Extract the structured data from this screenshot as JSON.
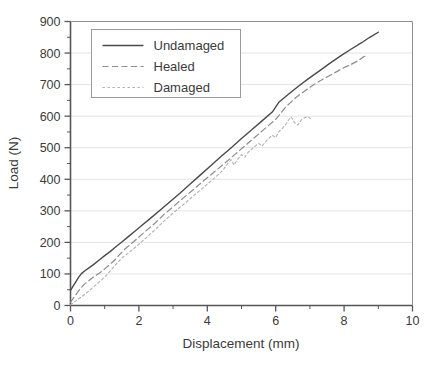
{
  "chart_data": {
    "type": "line",
    "title": "",
    "xlabel": "Displacement (mm)",
    "ylabel": "Load (N)",
    "xlim": [
      0,
      10
    ],
    "ylim": [
      0,
      900
    ],
    "xticks": [
      0,
      2,
      4,
      6,
      8,
      10
    ],
    "yticks": [
      0,
      100,
      200,
      300,
      400,
      500,
      600,
      700,
      800,
      900
    ],
    "xtick_labels": [
      "0",
      "2",
      "4",
      "6",
      "8",
      "10"
    ],
    "ytick_labels": [
      "0",
      "100",
      "200",
      "300",
      "400",
      "500",
      "600",
      "700",
      "800",
      "900"
    ],
    "x_minor_step": 1,
    "y_minor_step": 50,
    "grid": {
      "horizontal": true,
      "vertical": false,
      "color": "#e3e3e3"
    },
    "legend": {
      "position": "top-left-inside",
      "entries": [
        "Undamaged",
        "Healed",
        "Damaged"
      ]
    },
    "series": [
      {
        "name": "Undamaged",
        "style": "solid",
        "color": "#4a4a4a",
        "points": [
          [
            0.0,
            48
          ],
          [
            0.08,
            62
          ],
          [
            0.16,
            76
          ],
          [
            0.24,
            90
          ],
          [
            0.32,
            101
          ],
          [
            0.42,
            110
          ],
          [
            0.55,
            120
          ],
          [
            0.7,
            132
          ],
          [
            0.85,
            145
          ],
          [
            1.0,
            158
          ],
          [
            1.15,
            170
          ],
          [
            1.3,
            184
          ],
          [
            1.5,
            201
          ],
          [
            1.7,
            219
          ],
          [
            1.9,
            237
          ],
          [
            2.1,
            255
          ],
          [
            2.3,
            273
          ],
          [
            2.6,
            300
          ],
          [
            2.9,
            328
          ],
          [
            3.2,
            356
          ],
          [
            3.5,
            385
          ],
          [
            3.8,
            414
          ],
          [
            4.1,
            443
          ],
          [
            4.4,
            472
          ],
          [
            4.7,
            500
          ],
          [
            5.0,
            529
          ],
          [
            5.3,
            557
          ],
          [
            5.6,
            585
          ],
          [
            5.9,
            613
          ],
          [
            6.1,
            645
          ],
          [
            6.4,
            672
          ],
          [
            6.7,
            698
          ],
          [
            7.0,
            722
          ],
          [
            7.3,
            745
          ],
          [
            7.6,
            769
          ],
          [
            7.9,
            791
          ],
          [
            8.2,
            812
          ],
          [
            8.5,
            832
          ],
          [
            8.75,
            850
          ],
          [
            9.0,
            866
          ]
        ]
      },
      {
        "name": "Healed",
        "style": "dashed",
        "color": "#8c8c8c",
        "points": [
          [
            0.0,
            10
          ],
          [
            0.1,
            26
          ],
          [
            0.2,
            41
          ],
          [
            0.3,
            55
          ],
          [
            0.4,
            67
          ],
          [
            0.55,
            80
          ],
          [
            0.7,
            92
          ],
          [
            0.85,
            103
          ],
          [
            1.0,
            116
          ],
          [
            1.15,
            130
          ],
          [
            1.3,
            145
          ],
          [
            1.45,
            163
          ],
          [
            1.6,
            180
          ],
          [
            1.8,
            198
          ],
          [
            2.0,
            217
          ],
          [
            2.2,
            236
          ],
          [
            2.45,
            259
          ],
          [
            2.7,
            285
          ],
          [
            3.0,
            313
          ],
          [
            3.3,
            341
          ],
          [
            3.6,
            368
          ],
          [
            3.9,
            396
          ],
          [
            4.2,
            423
          ],
          [
            4.5,
            450
          ],
          [
            4.8,
            478
          ],
          [
            5.1,
            506
          ],
          [
            5.4,
            534
          ],
          [
            5.7,
            562
          ],
          [
            6.0,
            590
          ],
          [
            6.3,
            630
          ],
          [
            6.6,
            660
          ],
          [
            6.9,
            684
          ],
          [
            7.2,
            706
          ],
          [
            7.5,
            724
          ],
          [
            7.8,
            742
          ],
          [
            8.0,
            754
          ],
          [
            8.2,
            764
          ],
          [
            8.4,
            775
          ],
          [
            8.55,
            787
          ],
          [
            8.65,
            792
          ]
        ]
      },
      {
        "name": "Damaged",
        "style": "dotted",
        "color": "#b0b0b0",
        "points": [
          [
            0.0,
            2
          ],
          [
            0.15,
            14
          ],
          [
            0.3,
            26
          ],
          [
            0.45,
            38
          ],
          [
            0.6,
            52
          ],
          [
            0.75,
            66
          ],
          [
            0.9,
            80
          ],
          [
            1.05,
            96
          ],
          [
            1.2,
            114
          ],
          [
            1.35,
            133
          ],
          [
            1.5,
            150
          ],
          [
            1.7,
            167
          ],
          [
            1.9,
            185
          ],
          [
            2.1,
            204
          ],
          [
            2.3,
            223
          ],
          [
            2.5,
            243
          ],
          [
            2.7,
            264
          ],
          [
            3.0,
            293
          ],
          [
            3.3,
            320
          ],
          [
            3.6,
            348
          ],
          [
            3.9,
            375
          ],
          [
            4.2,
            403
          ],
          [
            4.45,
            428
          ],
          [
            4.6,
            450
          ],
          [
            4.7,
            462
          ],
          [
            4.78,
            445
          ],
          [
            4.88,
            462
          ],
          [
            5.0,
            478
          ],
          [
            5.1,
            470
          ],
          [
            5.2,
            486
          ],
          [
            5.35,
            500
          ],
          [
            5.5,
            514
          ],
          [
            5.6,
            505
          ],
          [
            5.75,
            525
          ],
          [
            5.9,
            540
          ],
          [
            6.0,
            532
          ],
          [
            6.1,
            552
          ],
          [
            6.2,
            562
          ],
          [
            6.3,
            575
          ],
          [
            6.4,
            592
          ],
          [
            6.45,
            598
          ],
          [
            6.55,
            580
          ],
          [
            6.65,
            572
          ],
          [
            6.75,
            588
          ],
          [
            6.85,
            596
          ],
          [
            6.95,
            598
          ],
          [
            7.02,
            592
          ]
        ]
      }
    ]
  }
}
